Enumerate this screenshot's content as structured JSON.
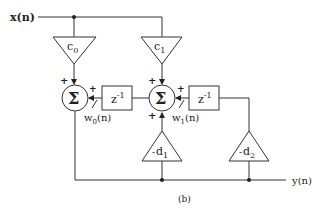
{
  "diagram": {
    "caption": "(b)",
    "input_label": "x(n)",
    "output_label": "y(n)",
    "feedforward_gains": [
      {
        "id": "c0",
        "label": "c",
        "sub": "0"
      },
      {
        "id": "c1",
        "label": "c",
        "sub": "1"
      }
    ],
    "feedback_gains": [
      {
        "id": "d1",
        "label": "d",
        "sub": "1",
        "sign": "-"
      },
      {
        "id": "d2",
        "label": "d",
        "sub": "2",
        "sign": "-"
      }
    ],
    "adders": [
      {
        "id": "sum0",
        "symbol": "Σ",
        "input_signs": [
          "+",
          "+"
        ]
      },
      {
        "id": "sum1",
        "symbol": "Σ",
        "input_signs": [
          "+",
          "+",
          "+"
        ]
      }
    ],
    "delays": [
      {
        "id": "z0",
        "label": "z",
        "exp": "-1"
      },
      {
        "id": "z1",
        "label": "z",
        "exp": "-1"
      }
    ],
    "states": [
      {
        "id": "w0",
        "label": "w",
        "sub": "0",
        "arg": "(n)"
      },
      {
        "id": "w1",
        "label": "w",
        "sub": "1",
        "arg": "(n)"
      }
    ],
    "plus": "+"
  }
}
